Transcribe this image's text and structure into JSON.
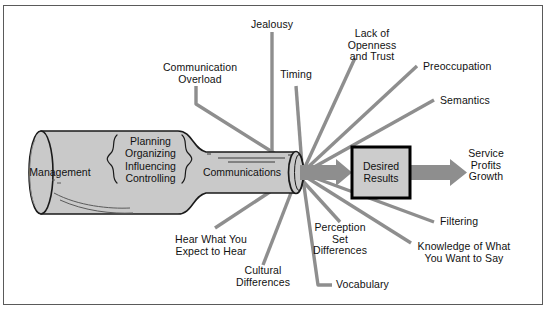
{
  "diagram": {
    "frame": {
      "border_color": "#5a5a5a",
      "background": "#ffffff"
    },
    "colors": {
      "funnel_fill": "#c9c9c9",
      "funnel_stroke": "#1a1a1a",
      "ray_color": "#8e8e8e",
      "arrow_color": "#8e8e8e",
      "box_fill": "#cccccc",
      "box_stroke": "#000000",
      "text": "#111111"
    },
    "funnel": {
      "source_label": "Management",
      "functions": [
        "Planning",
        "Organizing",
        "Influencing",
        "Controlling"
      ],
      "functions_text": "Planning\nOrganizing\nInfluencing\nControlling",
      "neck_label": "Communications",
      "left_brace": "{",
      "right_brace": "}"
    },
    "outcome": {
      "box_label": "Desired\nResults",
      "box_label_line1": "Desired",
      "box_label_line2": "Results",
      "results_text": "Service\nProfits\nGrowth",
      "results": [
        "Service",
        "Profits",
        "Growth"
      ]
    },
    "barriers": [
      {
        "id": "communication-overload",
        "text": "Communication\nOverload"
      },
      {
        "id": "jealousy",
        "text": "Jealousy"
      },
      {
        "id": "timing",
        "text": "Timing"
      },
      {
        "id": "lack-of-openness-and-trust",
        "text": "Lack of\nOpenness\nand Trust"
      },
      {
        "id": "preoccupation",
        "text": "Preoccupation"
      },
      {
        "id": "semantics",
        "text": "Semantics"
      },
      {
        "id": "filtering",
        "text": "Filtering"
      },
      {
        "id": "knowledge-of-what-you-want-to-say",
        "text": "Knowledge of What\nYou Want to Say"
      },
      {
        "id": "vocabulary",
        "text": "Vocabulary"
      },
      {
        "id": "perception-set-differences",
        "text": "Perception\nSet\nDifferences"
      },
      {
        "id": "cultural-differences",
        "text": "Cultural\nDifferences"
      },
      {
        "id": "hear-what-you-expect-to-hear",
        "text": "Hear What You\nExpect to Hear"
      }
    ]
  }
}
